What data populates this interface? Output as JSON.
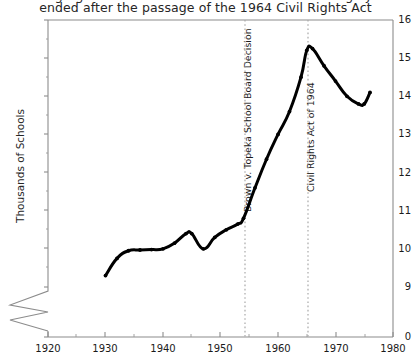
{
  "chart_data": {
    "type": "line",
    "title": "Segregated education in the American South largely",
    "title_line_2": "ended after the passage of the 1964 Civil Rights Act",
    "title_lines": [
      "Segregated education in the American South largely",
      "ended after the passage of the 1964 Civil Rights Act"
    ],
    "xlabel": "",
    "ylabel": "Thousands of Schools",
    "xlim": [
      1920,
      1980
    ],
    "ylim": [
      9,
      16
    ],
    "y_axis_break": true,
    "y_break_from": 0,
    "y_break_to": 9,
    "grid": false,
    "legend_position": "none",
    "xticks": [
      1920,
      1930,
      1940,
      1950,
      1960,
      1970,
      1980
    ],
    "xtick_labels": [
      "1920",
      "1930",
      "1940",
      "1950",
      "1960",
      "1970",
      "1980"
    ],
    "xminor_ticks": [
      1925,
      1935,
      1945,
      1955,
      1965,
      1975
    ],
    "yticks": [
      9,
      10,
      11,
      12,
      13,
      14,
      15,
      16
    ],
    "ytick_labels": [
      "9",
      "10",
      "11",
      "12",
      "13",
      "14",
      "15",
      "16"
    ],
    "y_zero_label": "0",
    "series": [
      {
        "name": "Thousands of Schools",
        "color": "#000000",
        "x": [
          1930,
          1932,
          1934,
          1936,
          1938,
          1940,
          1942,
          1944,
          1945,
          1947,
          1949,
          1951,
          1953,
          1954,
          1956,
          1958,
          1960,
          1962,
          1964,
          1965,
          1966,
          1968,
          1970,
          1972,
          1974,
          1975,
          1976
        ],
        "values": [
          9.3,
          9.75,
          9.95,
          9.97,
          9.98,
          10.0,
          10.15,
          10.4,
          10.4,
          10.0,
          10.3,
          10.5,
          10.65,
          10.8,
          11.6,
          12.35,
          13.0,
          13.6,
          14.5,
          15.2,
          15.25,
          14.8,
          14.4,
          14.0,
          13.8,
          13.8,
          14.1
        ]
      }
    ],
    "annotations": [
      {
        "label": "Brown v. Topeka School Board Decision",
        "x": 1954,
        "style": "dotted-vertical-line"
      },
      {
        "label": "Civil Rights Act of 1964",
        "x": 1965,
        "style": "dotted-vertical-line"
      }
    ]
  },
  "colors": {
    "line": "#000000",
    "axis": "#8c8c8c",
    "annotation_line": "#a0a0a0",
    "text": "#1a1a1a",
    "background": "#ffffff"
  }
}
